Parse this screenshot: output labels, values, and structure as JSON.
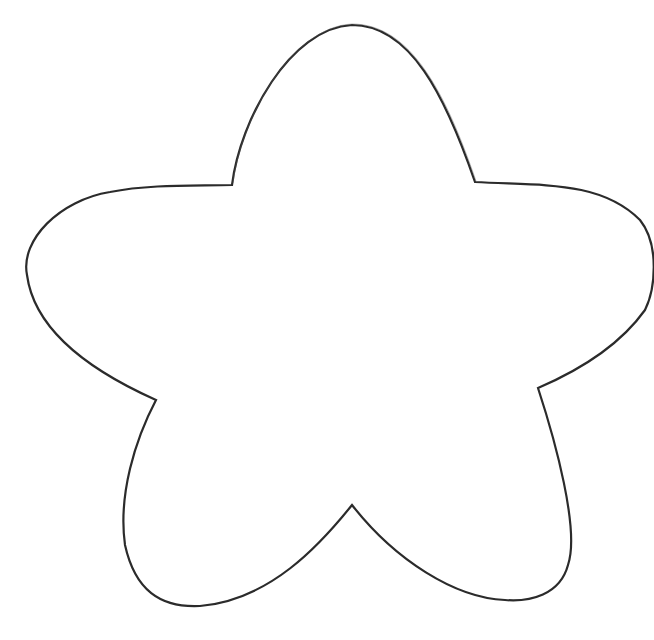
{
  "image": {
    "description": "Hand-drawn outline of a rounded five-petal flower / star shape on a white background",
    "background_color": "#ffffff",
    "stroke_color": "#2b2b2b"
  },
  "shape": {
    "name": "five-petal flower outline",
    "petals": 5,
    "points": {
      "top_tip": [
        355,
        25
      ],
      "upper_left_notch": [
        232,
        185
      ],
      "left_petal_extreme": [
        26,
        268
      ],
      "lower_left_notch": [
        156,
        400
      ],
      "bottom_left_petal_bottom": [
        200,
        606
      ],
      "bottom_notch": [
        352,
        505
      ],
      "bottom_right_petal_bottom": [
        510,
        598
      ],
      "lower_right_notch": [
        538,
        388
      ],
      "right_petal_extreme": [
        652,
        300
      ],
      "upper_right_notch": [
        475,
        182
      ]
    }
  }
}
